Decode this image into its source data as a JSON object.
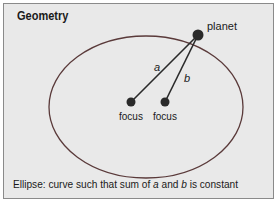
{
  "title": "Geometry",
  "labels": {
    "planet": "planet",
    "a": "a",
    "b": "b",
    "focus1": "focus",
    "focus2": "focus"
  },
  "caption": {
    "prefix": "Ellipse: curve such that sum of ",
    "a": "a",
    "mid": " and ",
    "b": "b",
    "suffix": " is constant"
  },
  "colors": {
    "background": "#e9e9e9",
    "border": "#8a8a8a",
    "ellipse": "#5a3a3a",
    "point": "#2a2a2a"
  }
}
